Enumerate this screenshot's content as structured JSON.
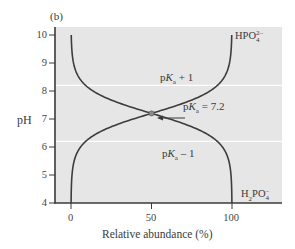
{
  "panel_label": "(b)",
  "chart_data": {
    "type": "line",
    "title": "",
    "panel": "(b)",
    "xlabel": "Relative abundance (%)",
    "ylabel": "pH",
    "xlim": [
      0,
      100
    ],
    "ylim": [
      4,
      10
    ],
    "x_ticks": [
      "0",
      "50",
      "100"
    ],
    "y_ticks": [
      "4",
      "5",
      "6",
      "7",
      "8",
      "9",
      "10"
    ],
    "grid": false,
    "reference_lines": [
      {
        "orientation": "horizontal",
        "y": 8.2,
        "label": "pKa + 1",
        "color": "#ffffff"
      },
      {
        "orientation": "horizontal",
        "y": 6.2,
        "label": "pKa − 1",
        "color": "#ffffff"
      }
    ],
    "annotations": [
      {
        "text": "pKa = 7.2",
        "x": 50,
        "y": 7.2,
        "arrow": true
      }
    ],
    "series": [
      {
        "name": "HPO4 2−",
        "label_position": "top-right",
        "description": "Relative abundance of HPO4(2−) rises with pH",
        "points": [
          [
            0.6,
            4.0
          ],
          [
            1.6,
            5.4
          ],
          [
            3.1,
            5.7
          ],
          [
            5.9,
            6.0
          ],
          [
            11.2,
            6.3
          ],
          [
            20.1,
            6.6
          ],
          [
            33.4,
            6.9
          ],
          [
            50.0,
            7.2
          ],
          [
            66.6,
            7.5
          ],
          [
            79.9,
            7.8
          ],
          [
            88.8,
            8.1
          ],
          [
            94.1,
            8.4
          ],
          [
            96.9,
            8.7
          ],
          [
            98.4,
            9.0
          ],
          [
            99.4,
            9.4
          ],
          [
            99.8,
            10.0
          ]
        ]
      },
      {
        "name": "H2PO4 −",
        "label_position": "bottom-right",
        "description": "Relative abundance of H2PO4(−) falls with pH",
        "points": [
          [
            0.2,
            10.0
          ],
          [
            0.6,
            9.4
          ],
          [
            1.6,
            9.0
          ],
          [
            3.1,
            8.7
          ],
          [
            5.9,
            8.4
          ],
          [
            11.2,
            8.1
          ],
          [
            20.1,
            7.8
          ],
          [
            33.4,
            7.5
          ],
          [
            50.0,
            7.2
          ],
          [
            66.6,
            6.9
          ],
          [
            79.9,
            6.6
          ],
          [
            88.8,
            6.3
          ],
          [
            94.1,
            6.0
          ],
          [
            96.9,
            5.7
          ],
          [
            98.4,
            5.4
          ],
          [
            99.4,
            4.0
          ]
        ]
      }
    ]
  },
  "labels": {
    "y_axis": "pH",
    "x_axis": "Relative abundance (%)",
    "pka_plus": {
      "p": "p",
      "K": "K",
      "sub": "a",
      "rest": " + 1"
    },
    "pka_minus": {
      "p": "p",
      "K": "K",
      "sub": "a",
      "rest": " – 1"
    },
    "pka_eq": {
      "p": "p",
      "K": "K",
      "sub": "a",
      "rest": " = 7.2"
    },
    "hpo4": {
      "base": "HPO",
      "sup": "2–",
      "sub": "4"
    },
    "h2po4": {
      "h": "H",
      "h_sub": "2",
      "base": "PO",
      "sup": "–",
      "sub": "4"
    }
  },
  "colors": {
    "plot_bg": "#e6e6e6",
    "curve": "#3d3d3d",
    "axis": "#3a3a3a",
    "ref_line": "#ffffff",
    "point": "#8a8a8a"
  }
}
